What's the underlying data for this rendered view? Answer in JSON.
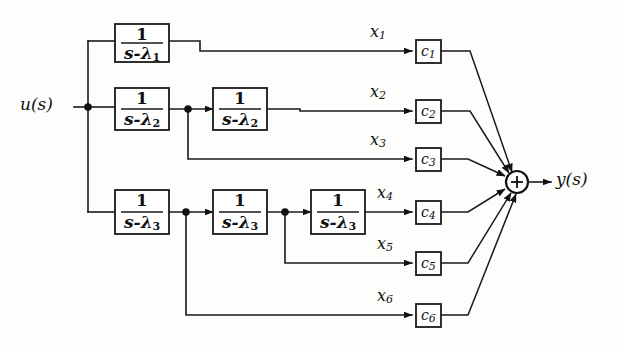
{
  "figure": {
    "kind": "block-diagram",
    "background_color": "#fdfdfb",
    "line_color": "#1a1a1a"
  },
  "io": {
    "input_label": "u(s)",
    "output_label": "y(s)"
  },
  "sum_junction": {
    "symbol": "+",
    "cx": 517,
    "cy": 182,
    "r": 11
  },
  "integrator_blocks": [
    {
      "id": "int-1",
      "numerator": "1",
      "denominator_base": "s-λ",
      "denominator_sub": "1",
      "x": 115,
      "y": 24,
      "w": 54,
      "h": 38
    },
    {
      "id": "int-2a",
      "numerator": "1",
      "denominator_base": "s-λ",
      "denominator_sub": "2",
      "x": 115,
      "y": 88,
      "w": 54,
      "h": 42
    },
    {
      "id": "int-2b",
      "numerator": "1",
      "denominator_base": "s-λ",
      "denominator_sub": "2",
      "x": 213,
      "y": 88,
      "w": 54,
      "h": 42
    },
    {
      "id": "int-3a",
      "numerator": "1",
      "denominator_base": "s-λ",
      "denominator_sub": "3",
      "x": 115,
      "y": 190,
      "w": 54,
      "h": 44
    },
    {
      "id": "int-3b",
      "numerator": "1",
      "denominator_base": "s-λ",
      "denominator_sub": "3",
      "x": 213,
      "y": 190,
      "w": 54,
      "h": 44
    },
    {
      "id": "int-3c",
      "numerator": "1",
      "denominator_base": "s-λ",
      "denominator_sub": "3",
      "x": 311,
      "y": 190,
      "w": 54,
      "h": 44
    }
  ],
  "state_signals": [
    {
      "id": "x1",
      "base": "x",
      "sub": "1",
      "lx": 370,
      "ly": 26,
      "line_y": 51
    },
    {
      "id": "x2",
      "base": "x",
      "sub": "2",
      "lx": 370,
      "ly": 86,
      "line_y": 111
    },
    {
      "id": "x3",
      "base": "x",
      "sub": "3",
      "lx": 370,
      "ly": 134,
      "line_y": 159
    },
    {
      "id": "x4",
      "base": "x",
      "sub": "4",
      "lx": 378,
      "ly": 187,
      "line_y": 212
    },
    {
      "id": "x5",
      "base": "x",
      "sub": "5",
      "lx": 378,
      "ly": 238,
      "line_y": 263
    },
    {
      "id": "x6",
      "base": "x",
      "sub": "6",
      "lx": 378,
      "ly": 290,
      "line_y": 315
    }
  ],
  "gain_blocks": [
    {
      "id": "c1",
      "base": "c",
      "sub": "1",
      "x": 416,
      "y": 40,
      "w": 25,
      "h": 23
    },
    {
      "id": "c2",
      "base": "c",
      "sub": "2",
      "x": 416,
      "y": 100,
      "w": 25,
      "h": 23
    },
    {
      "id": "c3",
      "base": "c",
      "sub": "3",
      "x": 416,
      "y": 148,
      "w": 25,
      "h": 23
    },
    {
      "id": "c4",
      "base": "c",
      "sub": "4",
      "x": 416,
      "y": 201,
      "w": 25,
      "h": 23
    },
    {
      "id": "c5",
      "base": "c",
      "sub": "5",
      "x": 416,
      "y": 252,
      "w": 25,
      "h": 23
    },
    {
      "id": "c6",
      "base": "c",
      "sub": "6",
      "x": 416,
      "y": 304,
      "w": 25,
      "h": 23
    }
  ],
  "junction_dots": [
    {
      "id": "input-tap",
      "cx": 88,
      "cy": 107,
      "r": 3.6
    },
    {
      "id": "tap-after-int2a",
      "cx": 188,
      "cy": 109,
      "r": 3.6
    },
    {
      "id": "tap-after-int3a",
      "cx": 186,
      "cy": 212,
      "r": 3.6
    },
    {
      "id": "tap-after-int3b",
      "cx": 285,
      "cy": 212,
      "r": 3.6
    }
  ]
}
